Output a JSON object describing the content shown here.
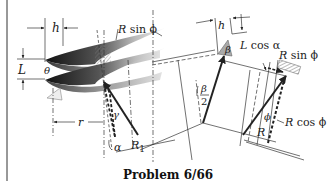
{
  "caption": "Problem 6/66",
  "labels": {
    "h_left": "h",
    "L_left": "L",
    "theta": "θ",
    "R_sin_phi_left_R": "R",
    "R_sin_phi_left_rest": " sin  ϕ",
    "gamma": "γ",
    "r": "r",
    "alpha": "α",
    "R1_R": "R",
    "R1_sub": "1",
    "h_mid": "h",
    "beta": "β",
    "beta_half_num": "β",
    "beta_half_den": "2",
    "L_cos_alpha_L": "L",
    "L_cos_alpha_rest": " cos  α",
    "R_sin_phi_right_R": "R",
    "R_sin_phi_right_rest": " sin  ϕ",
    "phi": "ϕ",
    "R_right": "R",
    "R_cos_phi_R": "R",
    "R_cos_phi_rest": " cos  ϕ"
  },
  "colors": {
    "ink": "#222222",
    "thread_dark": "#1a1a1a",
    "thread_light": "#d8d8d8",
    "hatch": "#9a9a9a"
  }
}
